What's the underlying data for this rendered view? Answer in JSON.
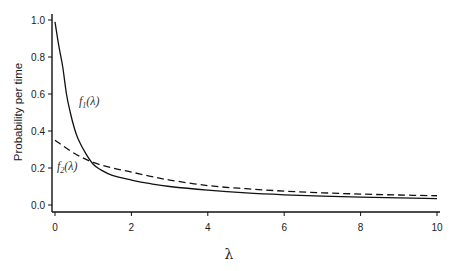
{
  "chart_data": {
    "type": "line",
    "title": "",
    "xlabel": "λ",
    "ylabel": "Probability per time",
    "xlim": [
      0,
      10
    ],
    "ylim": [
      0,
      1.0
    ],
    "xticks": [
      0,
      2,
      4,
      6,
      8,
      10
    ],
    "xtick_labels": [
      "0",
      "2",
      "4",
      "6",
      "8",
      "10"
    ],
    "yticks": [
      0.0,
      0.2,
      0.4,
      0.6,
      0.8,
      1.0
    ],
    "ytick_labels": [
      "0.0",
      "0.2",
      "0.4",
      "0.6",
      "0.8",
      "1.0"
    ],
    "grid": false,
    "legend": "inline labels",
    "series": [
      {
        "name": "f1(λ)",
        "style": "solid",
        "x": [
          0,
          0.1,
          0.2,
          0.3,
          0.4,
          0.5,
          0.6,
          0.8,
          1.0,
          1.2,
          1.5,
          2.0,
          2.5,
          3.0,
          4.0,
          5.0,
          6.0,
          7.0,
          8.0,
          9.0,
          10.0
        ],
        "values": [
          0.99,
          0.86,
          0.75,
          0.6,
          0.5,
          0.42,
          0.36,
          0.28,
          0.22,
          0.19,
          0.16,
          0.135,
          0.115,
          0.1,
          0.08,
          0.065,
          0.055,
          0.048,
          0.043,
          0.039,
          0.035
        ]
      },
      {
        "name": "f2(λ)",
        "style": "dashed",
        "x": [
          0,
          0.5,
          1.0,
          1.5,
          2.0,
          2.5,
          3.0,
          4.0,
          5.0,
          6.0,
          7.0,
          8.0,
          9.0,
          10.0
        ],
        "values": [
          0.35,
          0.28,
          0.23,
          0.2,
          0.178,
          0.155,
          0.135,
          0.105,
          0.088,
          0.075,
          0.066,
          0.059,
          0.054,
          0.05
        ]
      }
    ],
    "annotations": [
      {
        "text": "f1(λ)",
        "x": 0.7,
        "y": 0.56
      },
      {
        "text": "f2(λ)",
        "x": 0.1,
        "y": 0.2
      }
    ]
  },
  "labels": {
    "f1": "f",
    "f1_sub": "1",
    "f1_arg": "(λ)",
    "f2": "f",
    "f2_sub": "2",
    "f2_arg": "(λ)"
  }
}
